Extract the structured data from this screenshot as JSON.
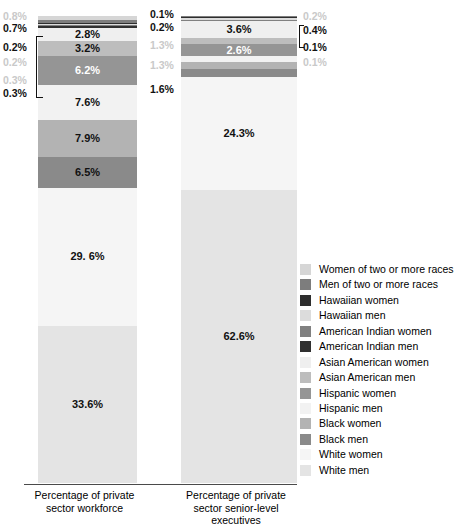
{
  "chart_data": {
    "type": "bar",
    "subtype": "stacked-bar-100-percent",
    "title": "",
    "xlabel": "",
    "ylabel": "",
    "ylim": [
      0,
      100
    ],
    "grid": false,
    "legend_position": "right",
    "categories": [
      "Percentage of private sector workforce",
      "Percentage of private sector senior-level executives"
    ],
    "series": [
      {
        "name": "Women of two or more races",
        "color": "#d6d6d6",
        "values": [
          0.8,
          0.1
        ]
      },
      {
        "name": "Men of two or more races",
        "color": "#7d7d7d",
        "values": [
          0.7,
          0.2
        ]
      },
      {
        "name": "Hawaiian women",
        "color": "#2e2e2e",
        "values": [
          0.2,
          0.2
        ]
      },
      {
        "name": "Hawaiian men",
        "color": "#dcdcdc",
        "values": [
          0.2,
          0.4
        ]
      },
      {
        "name": "American Indian women",
        "color": "#808080",
        "values": [
          0.3,
          0.1
        ]
      },
      {
        "name": "American Indian men",
        "color": "#303030",
        "values": [
          0.3,
          0.1
        ]
      },
      {
        "name": "Asian American women",
        "color": "#efefef",
        "values": [
          2.8,
          3.6
        ]
      },
      {
        "name": "Asian American men",
        "color": "#bdbdbd",
        "values": [
          3.2,
          1.3
        ]
      },
      {
        "name": "Hispanic women",
        "color": "#959595",
        "values": [
          6.2,
          2.6
        ]
      },
      {
        "name": "Hispanic men",
        "color": "#f2f2f2",
        "values": [
          7.6,
          1.3
        ]
      },
      {
        "name": "Black women",
        "color": "#b3b3b3",
        "values": [
          7.9,
          1.5
        ]
      },
      {
        "name": "Black men",
        "color": "#8a8a8a",
        "values": [
          6.5,
          1.6
        ]
      },
      {
        "name": "White women",
        "color": "#f5f5f5",
        "values": [
          29.6,
          24.3
        ]
      },
      {
        "name": "White men",
        "color": "#e4e4e4",
        "values": [
          33.6,
          62.6
        ]
      }
    ],
    "bar1_labels": [
      "0.8%",
      "0.7%",
      "0.2%",
      "0.2%",
      "0.3%",
      "0.3%",
      "2.8%",
      "3.2%",
      "6.2%",
      "7.6%",
      "7.9%",
      "6.5%",
      "29. 6%",
      "33.6%"
    ],
    "bar2_labels": [
      "0.1%",
      "0.2%",
      "0.2%",
      "0.4%",
      "0.1%",
      "0.1%",
      "3.6%",
      "1.3%",
      "2.6%",
      "1.3%",
      "1.5%",
      "1.6%",
      "24.3%",
      "62.6%"
    ]
  },
  "bar1": {
    "axis_label": "Percentage of private sector workforce",
    "inside_labels": {
      "asian_american_women": "2.8%",
      "asian_american_men": "3.2%",
      "hispanic_women": "6.2%",
      "hispanic_men": "7.6%",
      "black_women": "7.9%",
      "black_men": "6.5%",
      "white_women": "29. 6%",
      "white_men": "33.6%"
    },
    "callouts": {
      "women_two_or_more": "0.8%",
      "men_two_or_more": "0.7%",
      "hawaiian_women": "0.2%",
      "hawaiian_men": "0.2%",
      "american_indian_women": "0.3%",
      "american_indian_men": "0.3%"
    }
  },
  "bar2": {
    "axis_label_line1": "Percentage of private",
    "axis_label_line2": "sector senior-level",
    "axis_label_line3": "executives",
    "axis_label": "Percentage of private sector senior-level executives",
    "inside_labels": {
      "asian_american_women": "3.6%",
      "hispanic_women": "2.6%",
      "black_women": "1.5%",
      "white_women": "24.3%",
      "white_men": "62.6%"
    },
    "callouts_left": {
      "women_two_or_more": "0.1%",
      "men_two_or_more": "0.2%",
      "asian_american_men": "1.3%",
      "hispanic_men": "1.3%",
      "black_men": "1.6%"
    },
    "callouts_right": {
      "hawaiian_women": "0.2%",
      "hawaiian_men": "0.4%",
      "american_indian_women": "0.1%",
      "american_indian_men": "0.1%"
    }
  },
  "bar1_axis": {
    "line1": "Percentage of private",
    "line2": "sector workforce"
  },
  "legend": {
    "items": [
      {
        "label": "Women of two or more races",
        "color": "#d6d6d6"
      },
      {
        "label": "Men of two or more races",
        "color": "#7d7d7d"
      },
      {
        "label": "Hawaiian women",
        "color": "#2e2e2e"
      },
      {
        "label": "Hawaiian men",
        "color": "#dcdcdc"
      },
      {
        "label": "American Indian women",
        "color": "#808080"
      },
      {
        "label": "American Indian men",
        "color": "#303030"
      },
      {
        "label": "Asian American women",
        "color": "#efefef"
      },
      {
        "label": "Asian American men",
        "color": "#bdbdbd"
      },
      {
        "label": "Hispanic women",
        "color": "#959595"
      },
      {
        "label": "Hispanic men",
        "color": "#f2f2f2"
      },
      {
        "label": "Black women",
        "color": "#b3b3b3"
      },
      {
        "label": "Black men",
        "color": "#8a8a8a"
      },
      {
        "label": "White women",
        "color": "#f5f5f5"
      },
      {
        "label": "White men",
        "color": "#e4e4e4"
      }
    ]
  }
}
